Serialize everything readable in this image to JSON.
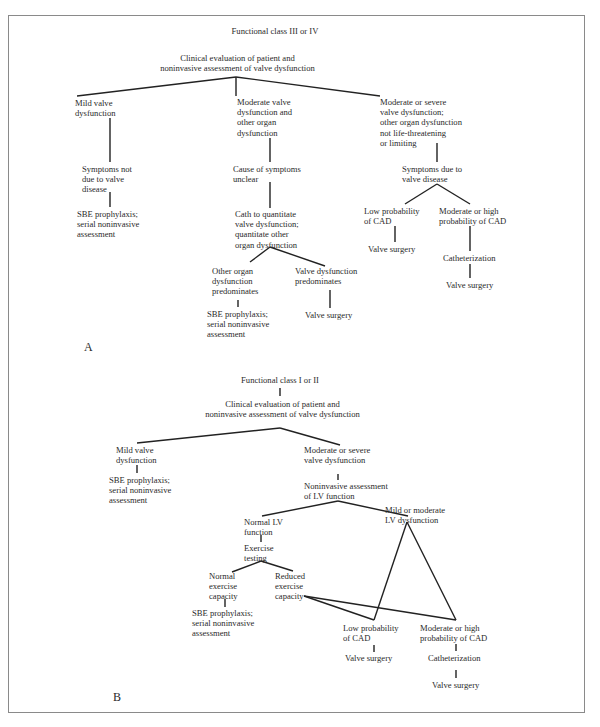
{
  "panel_a": {
    "label": "A",
    "title": "Functional class III or IV",
    "root": "Clinical evaluation of patient and\nnoninvasive assessment of valve dysfunction",
    "branch_mild": "Mild valve\ndysfunction",
    "branch_moderate": "Moderate valve\ndysfunction and\nother organ\ndysfunction",
    "branch_severe": "Moderate or severe\nvalve dysfunction;\nother organ dysfunction\nnot life-threatening\nor limiting",
    "mild_symptoms": "Symptoms not\ndue to valve\ndisease",
    "mild_outcome": "SBE prophylaxis;\nserial noninvasive\nassessment",
    "moderate_cause": "Cause of symptoms\nunclear",
    "moderate_cath": "Cath to quantitate\nvalve dysfunction;\nquantitate other\norgan dysfunction",
    "other_organ": "Other organ\ndysfunction\npredominates",
    "other_organ_outcome": "SBE prophylaxis;\nserial noninvasive\nassessment",
    "valve_predominates": "Valve dysfunction\npredominates",
    "valve_predominates_outcome": "Valve surgery",
    "severe_symptoms": "Symptoms due to\nvalve disease",
    "low_cad": "Low probability\nof CAD",
    "low_cad_outcome": "Valve surgery",
    "high_cad": "Moderate or high\nprobability of CAD",
    "high_cad_cath": "Catheterization",
    "high_cad_outcome": "Valve surgery"
  },
  "panel_b": {
    "label": "B",
    "title": "Functional class I or II",
    "root": "Clinical evaluation of patient and\nnoninvasive assessment of valve dysfunction",
    "branch_mild": "Mild valve\ndysfunction",
    "mild_outcome": "SBE prophylaxis;\nserial noninvasive\nassessment",
    "branch_severe": "Moderate or severe\nvalve dysfunction",
    "lv_assessment": "Noninvasive assessment\nof LV function",
    "normal_lv": "Normal LV\nfunction",
    "exercise_testing": "Exercise\ntesting",
    "normal_capacity": "Normal\nexercise\ncapacity",
    "normal_capacity_outcome": "SBE prophylaxis;\nserial noninvasive\nassessment",
    "reduced_capacity": "Reduced\nexercise\ncapacity",
    "mild_lv_dysfunction": "Mild or moderate\nLV dysfunction",
    "low_cad": "Low probability\nof CAD",
    "low_cad_outcome": "Valve surgery",
    "high_cad": "Moderate or high\nprobability of CAD",
    "high_cad_cath": "Catheterization",
    "high_cad_outcome": "Valve surgery"
  }
}
